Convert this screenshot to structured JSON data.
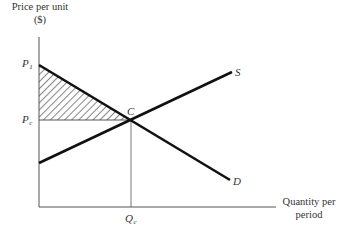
{
  "diagram": {
    "type": "supply-demand-consumer-surplus",
    "y_axis": {
      "label_line1": "Price per unit",
      "label_line2": "($)"
    },
    "x_axis": {
      "label_line1": "Quantity per",
      "label_line2": "period"
    },
    "price_labels": {
      "p1": {
        "main": "P",
        "sub": "1"
      },
      "pc": {
        "main": "P",
        "sub": "c"
      }
    },
    "quantity_labels": {
      "qc": {
        "main": "Q",
        "sub": "c"
      }
    },
    "curves": {
      "supply": {
        "label": "S"
      },
      "demand": {
        "label": "D"
      }
    },
    "equilibrium": {
      "label": "C"
    },
    "shaded_region": "consumer surplus (hatched triangle between P1, Pc and C)",
    "colors": {
      "curve": "#111111",
      "axis": "#555555",
      "text": "#333333",
      "background": "#ffffff"
    }
  }
}
